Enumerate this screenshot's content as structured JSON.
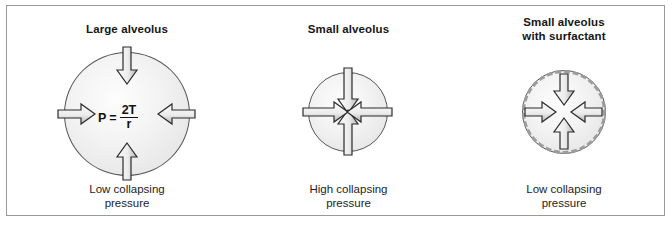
{
  "figure": {
    "border_color": "#9a9a9a",
    "background": "#ffffff"
  },
  "panels": [
    {
      "id": "large",
      "title": "Large alveolus",
      "caption_line1": "Low collapsing",
      "caption_line2": "pressure",
      "circle": {
        "diameter_px": 125,
        "fill": "#f2f2f2",
        "stroke": "#555555",
        "has_surfactant_ring": false
      },
      "formula": {
        "lhs": "P",
        "equals": "=",
        "numerator": "2T",
        "denominator": "r"
      },
      "arrows": [
        {
          "direction": "down",
          "name": "arrow-top"
        },
        {
          "direction": "up",
          "name": "arrow-bottom"
        },
        {
          "direction": "right",
          "name": "arrow-left"
        },
        {
          "direction": "left",
          "name": "arrow-right"
        }
      ]
    },
    {
      "id": "small",
      "title": "Small alveolus",
      "caption_line1": "High collapsing",
      "caption_line2": "pressure",
      "circle": {
        "diameter_px": 79,
        "fill": "#f2f2f2",
        "stroke": "#555555",
        "has_surfactant_ring": false
      },
      "arrows": [
        {
          "direction": "down",
          "name": "arrow-top"
        },
        {
          "direction": "up",
          "name": "arrow-bottom"
        },
        {
          "direction": "right",
          "name": "arrow-left"
        },
        {
          "direction": "left",
          "name": "arrow-right"
        }
      ]
    },
    {
      "id": "surfactant",
      "title_line1": "Small alveolus",
      "title_line2": "with surfactant",
      "caption_line1": "Low collapsing",
      "caption_line2": "pressure",
      "circle": {
        "diameter_px": 83,
        "fill": "#f2f2f2",
        "stroke": "#555555",
        "has_surfactant_ring": true,
        "ring_color": "#9c9c9c",
        "ring_style": "dashed"
      },
      "arrows": [
        {
          "direction": "down",
          "name": "arrow-top"
        },
        {
          "direction": "up",
          "name": "arrow-bottom"
        },
        {
          "direction": "right",
          "name": "arrow-left"
        },
        {
          "direction": "left",
          "name": "arrow-right"
        }
      ]
    }
  ],
  "colors": {
    "arrow_stroke": "#2b2b2b",
    "arrow_fill_light": "#fbfbfb",
    "arrow_fill_dark": "#b9b9b9",
    "text": "#161616"
  }
}
